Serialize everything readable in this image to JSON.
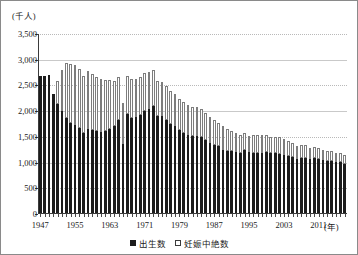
{
  "chart_data": {
    "type": "bar",
    "subtype": "stacked-vertical",
    "title": "",
    "subtitle": "",
    "xlabel": "(年)",
    "ylabel": "(千人)",
    "ylim": [
      0,
      3500
    ],
    "ytick_step": 500,
    "ytick_labels": [
      "3,500",
      "3,000",
      "2,500",
      "2,000",
      "1,500",
      "1,000",
      "500",
      "0"
    ],
    "ytick_values": [
      3500,
      3000,
      2500,
      2000,
      1500,
      1000,
      500,
      0
    ],
    "xtick_labels": [
      "1947",
      "1955",
      "1963",
      "1971",
      "1979",
      "1987",
      "1995",
      "2003",
      "2011"
    ],
    "xtick_values": [
      1947,
      1955,
      1963,
      1971,
      1979,
      1987,
      1995,
      2003,
      2011
    ],
    "xlim": [
      1947,
      2015
    ],
    "grid": "horizontal-dotted",
    "legend_position": "bottom-center",
    "legend": [
      "出生数",
      "妊娠中絶数"
    ],
    "series": [
      {
        "name": "出生数",
        "color": "#1c1c1c",
        "style": "filled",
        "values": [
          2679,
          2682,
          2697,
          2338,
          2138,
          2005,
          1868,
          1770,
          1731,
          1665,
          1567,
          1653,
          1626,
          1606,
          1589,
          1619,
          1659,
          1717,
          1824,
          1360,
          1936,
          1872,
          1890,
          1934,
          2001,
          2039,
          2092,
          1902,
          1901,
          1833,
          1755,
          1709,
          1643,
          1577,
          1529,
          1515,
          1509,
          1490,
          1432,
          1383,
          1347,
          1314,
          1247,
          1222,
          1223,
          1209,
          1188,
          1238,
          1197,
          1187,
          1192,
          1191,
          1203,
          1178,
          1191,
          1171,
          1154,
          1124,
          1111,
          1063,
          1084,
          1093,
          1063,
          1090,
          1071,
          1051,
          1037,
          1030,
          1007,
          1004,
          981
        ]
      },
      {
        "name": "妊娠中絶数",
        "color": "#ffffff",
        "style": "hollow-outline",
        "values": [
          0,
          0,
          0,
          0,
          458,
          805,
          1068,
          1143,
          1170,
          1159,
          1122,
          1128,
          1099,
          1063,
          1035,
          985,
          955,
          879,
          844,
          808,
          748,
          757,
          744,
          732,
          739,
          732,
          701,
          679,
          671,
          664,
          642,
          619,
          598,
          597,
          590,
          568,
          568,
          550,
          529,
          498,
          486,
          462,
          456,
          436,
          386,
          364,
          343,
          338,
          320,
          341,
          337,
          342,
          341,
          320,
          301,
          319,
          301,
          289,
          276,
          256,
          256,
          242,
          224,
          213,
          213,
          202,
          196,
          186,
          181,
          177,
          176
        ]
      }
    ],
    "x": [
      1947,
      1948,
      1949,
      1950,
      1951,
      1952,
      1953,
      1954,
      1955,
      1956,
      1957,
      1958,
      1959,
      1960,
      1961,
      1962,
      1963,
      1964,
      1965,
      1966,
      1967,
      1968,
      1969,
      1970,
      1971,
      1972,
      1973,
      1974,
      1975,
      1976,
      1977,
      1978,
      1979,
      1980,
      1981,
      1982,
      1983,
      1984,
      1985,
      1986,
      1987,
      1988,
      1989,
      1990,
      1991,
      1992,
      1993,
      1994,
      1995,
      1996,
      1997,
      1998,
      1999,
      2000,
      2001,
      2002,
      2003,
      2004,
      2005,
      2006,
      2007,
      2008,
      2009,
      2010,
      2011,
      2012,
      2013,
      2014,
      2015,
      2016,
      2017
    ]
  },
  "axis": {
    "y_unit": "(千人)",
    "x_unit": "(年)"
  },
  "legend": {
    "items": [
      {
        "label": "出生数",
        "swatch": "filled-square-icon"
      },
      {
        "label": "妊娠中絶数",
        "swatch": "hollow-square-icon"
      }
    ]
  }
}
